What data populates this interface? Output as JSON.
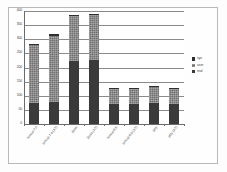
{
  "chart_data": {
    "type": "bar",
    "stacked": true,
    "title": "",
    "xlabel": "",
    "ylabel": "",
    "ylim": [
      0,
      400
    ],
    "yticks": [
      0,
      50,
      100,
      150,
      200,
      250,
      300,
      350,
      400
    ],
    "ytick_labels": [
      "0",
      "50",
      "100",
      "150",
      "200",
      "250",
      "300",
      "350",
      "400"
    ],
    "grid": true,
    "legend_position": "right",
    "categories": [
      "tomcat-7.0",
      "tomcat-7.0 (JIT)",
      "jboss",
      "jboss (JIT)",
      "tomcat-5.5",
      "tomcat-5.5 (JIT)",
      "jetty",
      "jetty (JIT)"
    ],
    "series": [
      {
        "name": "real",
        "values": [
          75,
          78,
          222,
          228,
          72,
          70,
          75,
          70
        ]
      },
      {
        "name": "user",
        "values": [
          205,
          235,
          160,
          158,
          52,
          55,
          55,
          55
        ]
      },
      {
        "name": "sys",
        "values": [
          5,
          5,
          5,
          5,
          3,
          3,
          3,
          3
        ]
      }
    ],
    "totals": [
      285,
      318,
      387,
      391,
      127,
      128,
      133,
      128
    ],
    "colors": {
      "real": "#3a3a3a",
      "user": "#6f6f6f",
      "sys": "#2f2f2f",
      "grid": "#8a8a8a",
      "axis": "#6b6b6b",
      "plot_background": "#ffffff",
      "frame_border": "#b9b9b9"
    }
  },
  "legend": {
    "entries": [
      {
        "label": "sys"
      },
      {
        "label": "user"
      },
      {
        "label": "real"
      }
    ]
  }
}
